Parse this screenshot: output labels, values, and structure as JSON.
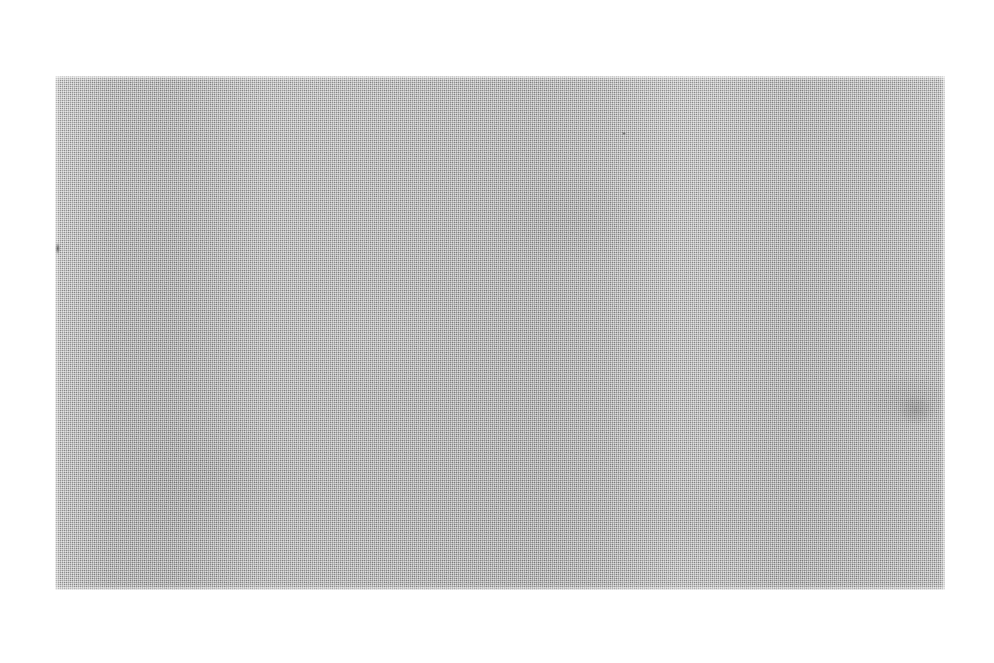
{
  "canvas": {
    "width": 994,
    "height": 663,
    "background_color": "#ffffff",
    "description": "Scanned blank gray panel on white paper background. No text, icons, or interface elements are present."
  },
  "panel": {
    "name": "blank-gray-panel",
    "x": 55,
    "y": 76,
    "width": 890,
    "height": 514,
    "fill_color": "#bdbdbd",
    "texture": "halftone-dither-checkerboard",
    "texture_cell_px": 2,
    "edge": "soft-feathered",
    "mean_luminance": 189,
    "has_text": false,
    "has_controls": false
  },
  "tone_variation": {
    "type": "vertical-banding",
    "darker_band_centers_x": [
      150,
      580,
      810
    ],
    "lighter_band_center_x": 695,
    "vertical_drift": "top slightly lighter, lower-middle slightly darker"
  },
  "defects": [
    {
      "name": "left-edge-smudge",
      "x": 55,
      "y": 243,
      "width": 5,
      "height": 11,
      "color": "#282828",
      "shape": "elongated-blot"
    },
    {
      "name": "upper-speck",
      "x": 622,
      "y": 132,
      "width": 4,
      "height": 3,
      "color": "#373737",
      "shape": "dot"
    },
    {
      "name": "right-mottled-patch",
      "x": 898,
      "y": 396,
      "width": 36,
      "height": 28,
      "color": "#505050",
      "shape": "soft-blotch"
    }
  ],
  "colors": {
    "paper": "#ffffff",
    "panel_mid": "#bdbdbd",
    "panel_light": "#cfcfcf",
    "panel_dark": "#a9a9a9",
    "defect_dark": "#282828"
  }
}
